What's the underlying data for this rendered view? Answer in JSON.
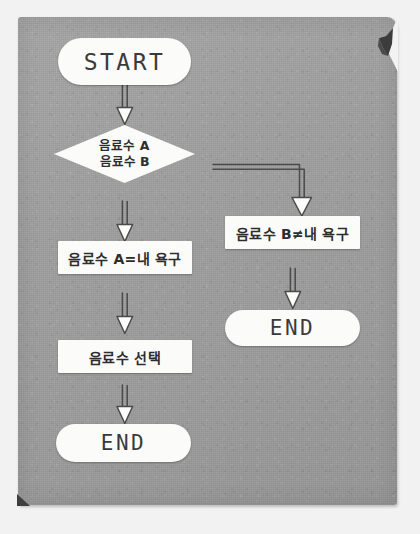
{
  "diagram": {
    "language": "ko",
    "colors": {
      "paper": "#9d9d9d",
      "node_fill": "#fbfbfa",
      "ink": "#2d2d2d",
      "arrow": "#4a4a4a",
      "corner_fold": "#3c3c3c",
      "page_background": "#f2f2f2"
    },
    "nodes": [
      {
        "id": "start",
        "type": "terminal",
        "label": "START"
      },
      {
        "id": "decision",
        "type": "decision",
        "label": "음료수 A\n음료수 B",
        "line1": "음료수 A",
        "line2": "음료수 B"
      },
      {
        "id": "drink-a-yes",
        "type": "process",
        "label": "음료수 A=내 욕구"
      },
      {
        "id": "drink-b-no",
        "type": "process",
        "label": "음료수 B≠내 욕구"
      },
      {
        "id": "select-drink",
        "type": "process",
        "label": "음료수 선택"
      },
      {
        "id": "end-left",
        "type": "terminal",
        "label": "END"
      },
      {
        "id": "end-right",
        "type": "terminal",
        "label": "END"
      }
    ],
    "connectors": [
      {
        "id": "start-to-decision",
        "from": "start",
        "to": "decision",
        "style": "straight-down",
        "label": ""
      },
      {
        "id": "decision-to-drink-a",
        "from": "decision",
        "to": "drink-a-yes",
        "style": "straight-down",
        "label": ""
      },
      {
        "id": "decision-to-drink-b",
        "from": "decision",
        "to": "drink-b-no",
        "style": "elbow-right-down",
        "label": ""
      },
      {
        "id": "drink-a-to-select",
        "from": "drink-a-yes",
        "to": "select-drink",
        "style": "straight-down",
        "label": ""
      },
      {
        "id": "select-to-end-left",
        "from": "select-drink",
        "to": "end-left",
        "style": "straight-down",
        "label": ""
      },
      {
        "id": "drink-b-to-end-right",
        "from": "drink-b-no",
        "to": "end-right",
        "style": "straight-down",
        "label": ""
      }
    ]
  }
}
